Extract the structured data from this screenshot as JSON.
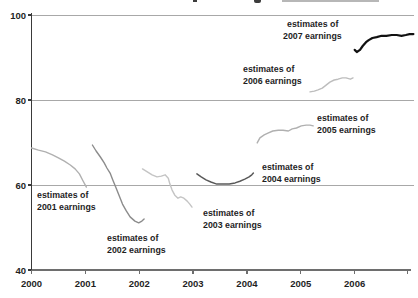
{
  "chart_data": {
    "type": "line",
    "title": "",
    "xlabel": "",
    "ylabel": "",
    "xlim": [
      2000,
      2007.1
    ],
    "ylim": [
      40,
      100
    ],
    "grid": "horizontal gridlines at 60, 80, 100",
    "legend": "none - inline text annotations next to each line",
    "x_ticks": [
      {
        "value": 2000,
        "label": "2000"
      },
      {
        "value": 2001,
        "label": "2001"
      },
      {
        "value": 2002,
        "label": "2002"
      },
      {
        "value": 2003,
        "label": "2003"
      },
      {
        "value": 2004,
        "label": "2004"
      },
      {
        "value": 2005,
        "label": "2005"
      },
      {
        "value": 2006,
        "label": "2006"
      }
    ],
    "x_axis_end_tick": 2006.98,
    "y_ticks": [
      {
        "value": 100,
        "label": "100"
      },
      {
        "value": 80,
        "label": "80"
      },
      {
        "value": 60,
        "label": "60"
      },
      {
        "value": 40,
        "label": "40"
      }
    ],
    "gridline_values": [
      100,
      80,
      60
    ],
    "colors": {
      "axis_left": "#3a3a3a",
      "axis_bottom": "#6e6e6e",
      "grid": "#a8a8a8",
      "annotation_text": "#1f1f1f"
    },
    "series": [
      {
        "key": "2001",
        "name": "estimates of 2001 earnings",
        "color": "#b0b0b0",
        "stroke_width": 1.4,
        "x": [
          2000.0,
          2000.13,
          2000.26,
          2000.39,
          2000.5,
          2000.61,
          2000.72,
          2000.81,
          2000.89,
          2000.96,
          2001.02
        ],
        "y": [
          68.7,
          68.2,
          67.8,
          67.1,
          66.4,
          65.6,
          64.7,
          63.8,
          62.6,
          60.9,
          59.5
        ]
      },
      {
        "key": "2002",
        "name": "estimates of 2002 earnings",
        "color": "#8c8c8c",
        "stroke_width": 1.4,
        "x": [
          2001.13,
          2001.2,
          2001.28,
          2001.35,
          2001.4,
          2001.46,
          2001.51,
          2001.57,
          2001.63,
          2001.69,
          2001.76,
          2001.83,
          2001.92,
          2001.99,
          2002.05,
          2002.09
        ],
        "y": [
          69.4,
          68.0,
          66.6,
          65.2,
          64.0,
          62.8,
          61.2,
          59.3,
          57.4,
          55.5,
          53.9,
          52.5,
          51.5,
          51.1,
          51.5,
          52.0
        ]
      },
      {
        "key": "2003",
        "name": "estimates of 2003 earnings",
        "color": "#c4c4c4",
        "stroke_width": 1.4,
        "x": [
          2002.06,
          2002.15,
          2002.24,
          2002.33,
          2002.41,
          2002.48,
          2002.54,
          2002.57,
          2002.61,
          2002.66,
          2002.72,
          2002.77,
          2002.83,
          2002.89,
          2002.94,
          2002.98
        ],
        "y": [
          63.8,
          63.1,
          62.4,
          61.9,
          62.1,
          62.4,
          61.6,
          60.2,
          58.8,
          57.6,
          56.9,
          57.2,
          56.9,
          56.2,
          55.5,
          54.8
        ]
      },
      {
        "key": "2004",
        "name": "estimates of 2004 earnings",
        "color": "#595959",
        "stroke_width": 1.5,
        "x": [
          2003.07,
          2003.15,
          2003.24,
          2003.33,
          2003.44,
          2003.56,
          2003.67,
          2003.78,
          2003.87,
          2003.96,
          2004.04,
          2004.09,
          2004.12
        ],
        "y": [
          62.6,
          61.9,
          61.2,
          60.7,
          60.2,
          60.2,
          60.2,
          60.5,
          60.9,
          61.4,
          61.9,
          62.4,
          62.8
        ]
      },
      {
        "key": "2005",
        "name": "estimates of 2005 earnings",
        "color": "#b0b0b0",
        "stroke_width": 1.4,
        "x": [
          2004.19,
          2004.24,
          2004.32,
          2004.39,
          2004.48,
          2004.58,
          2004.67,
          2004.77,
          2004.84,
          2004.92,
          2005.01,
          2005.1,
          2005.17,
          2005.23
        ],
        "y": [
          69.9,
          71.1,
          71.8,
          72.2,
          72.7,
          72.9,
          72.9,
          72.7,
          73.2,
          73.4,
          73.9,
          74.1,
          74.1,
          73.9
        ]
      },
      {
        "key": "2006",
        "name": "estimates of 2006 earnings",
        "color": "#bdbdbd",
        "stroke_width": 1.4,
        "x": [
          2005.17,
          2005.25,
          2005.32,
          2005.4,
          2005.47,
          2005.54,
          2005.62,
          2005.69,
          2005.77,
          2005.84,
          2005.92,
          2005.97
        ],
        "y": [
          81.9,
          82.1,
          82.4,
          82.8,
          83.5,
          84.2,
          84.7,
          84.9,
          85.2,
          85.2,
          84.9,
          85.2
        ]
      },
      {
        "key": "2007",
        "name": "estimates of 2007 earnings",
        "color": "#111111",
        "stroke_width": 2.2,
        "x": [
          2006.0,
          2006.04,
          2006.1,
          2006.15,
          2006.21,
          2006.26,
          2006.33,
          2006.41,
          2006.5,
          2006.59,
          2006.69,
          2006.78,
          2006.87,
          2006.95,
          2007.02,
          2007.09
        ],
        "y": [
          91.8,
          91.3,
          91.8,
          92.7,
          93.6,
          94.1,
          94.6,
          94.8,
          95.1,
          95.1,
          95.3,
          95.3,
          95.1,
          95.3,
          95.5,
          95.5
        ]
      }
    ],
    "annotations": [
      {
        "key": "2001",
        "line1": "estimates of",
        "line2": "2001 earnings",
        "px": [
          37,
          198
        ]
      },
      {
        "key": "2002",
        "line1": "estimates of",
        "line2": "2002 earnings",
        "px": [
          107,
          241
        ]
      },
      {
        "key": "2003",
        "line1": "estimates of",
        "line2": "2003 earnings",
        "px": [
          203,
          216
        ]
      },
      {
        "key": "2004",
        "line1": "estimates of",
        "line2": "2004 earnings",
        "px": [
          262,
          170
        ]
      },
      {
        "key": "2005",
        "line1": "estimates of",
        "line2": "2005 earnings",
        "px": [
          317,
          121
        ]
      },
      {
        "key": "2006",
        "line1": "estimates of",
        "line2": "2006 earnings",
        "px": [
          243,
          72
        ]
      },
      {
        "key": "2007",
        "line1": "estimates of",
        "line2": "2007 earnings",
        "px": [
          287,
          27
        ],
        "x2": 283
      }
    ]
  }
}
